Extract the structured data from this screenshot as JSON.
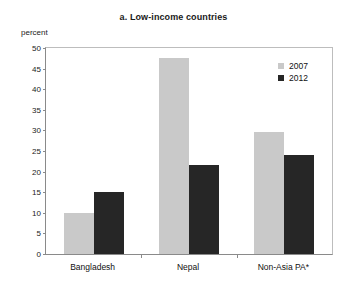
{
  "cut_off_header": "2007 and 2012",
  "panel_title": "a. Low-income countries",
  "y_unit_label": "percent",
  "legend": {
    "items": [
      {
        "label": "2007",
        "color": "#c9c9c9",
        "swatch": "legend-swatch-2007"
      },
      {
        "label": "2012",
        "color": "#262626",
        "swatch": "legend-swatch-2012"
      }
    ]
  },
  "axis": {
    "ticks": [
      "50",
      "45",
      "40",
      "35",
      "30",
      "25",
      "20",
      "15",
      "10",
      "5",
      "0"
    ]
  },
  "chart_data": {
    "type": "bar",
    "title": "a. Low-income countries",
    "xlabel": "",
    "ylabel": "percent",
    "ylim": [
      0,
      50
    ],
    "ytick_step": 5,
    "grid": false,
    "legend_position": "top-right",
    "categories": [
      "Bangladesh",
      "Nepal",
      "Non-Asia PA*"
    ],
    "series": [
      {
        "name": "2007",
        "color": "#c9c9c9",
        "values": [
          10.0,
          47.5,
          29.5
        ]
      },
      {
        "name": "2012",
        "color": "#262626",
        "values": [
          15.0,
          21.5,
          24.0
        ]
      }
    ],
    "footnote_marker": "*"
  }
}
